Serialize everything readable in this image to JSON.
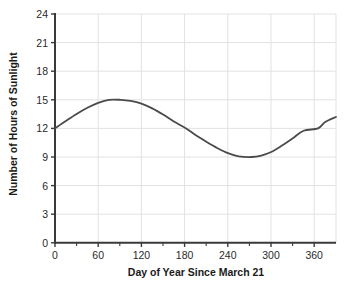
{
  "chart_data": {
    "type": "line",
    "title": "",
    "subtitle": "",
    "xlabel": "Day of Year Since March 21",
    "ylabel": "Number of Hours of Sunlight",
    "xlim": [
      0,
      390
    ],
    "ylim": [
      0,
      24
    ],
    "xticks": [
      0,
      60,
      120,
      180,
      240,
      300,
      360
    ],
    "yticks": [
      0,
      3,
      6,
      9,
      12,
      15,
      18,
      21,
      24
    ],
    "xtick_labels": [
      "0",
      "60",
      "120",
      "180",
      "240",
      "300",
      "360"
    ],
    "ytick_labels": [
      "0",
      "3",
      "6",
      "9",
      "12",
      "15",
      "18",
      "21",
      "24"
    ],
    "grid": true,
    "legend": "none",
    "annotations": [],
    "series": [
      {
        "name": "Hours of Sunlight",
        "color": "#4a4a4a",
        "line_width": 1.8,
        "equation": "y = 12 + 3*sin(2*pi*x/365)",
        "x": [
          0,
          15,
          30,
          45,
          60,
          75,
          91,
          105,
          120,
          135,
          150,
          165,
          182,
          195,
          210,
          225,
          240,
          255,
          273,
          285,
          300,
          315,
          330,
          345,
          365,
          375,
          390
        ],
        "y": [
          12.0,
          12.77,
          13.51,
          14.16,
          14.68,
          15.0,
          15.0,
          14.88,
          14.6,
          14.1,
          13.45,
          12.72,
          12.0,
          11.3,
          10.6,
          9.95,
          9.4,
          9.07,
          9.0,
          9.12,
          9.53,
          10.2,
          10.96,
          11.75,
          12.0,
          12.67,
          13.2
        ]
      }
    ]
  },
  "axes": {
    "ylabel": "Number of Hours of Sunlight",
    "xlabel": "Day of Year Since March 21"
  }
}
